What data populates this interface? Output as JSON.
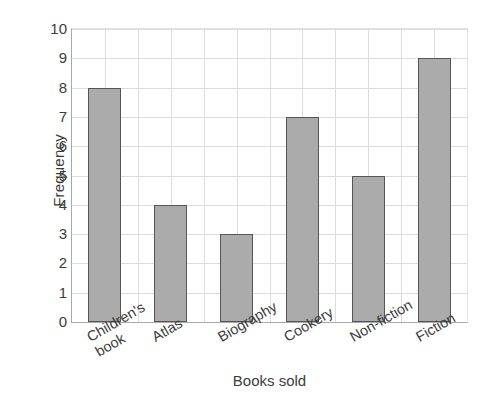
{
  "chart_data": {
    "type": "bar",
    "title": "",
    "xlabel": "Books sold",
    "ylabel": "Frequency",
    "categories": [
      "Children's book",
      "Atlas",
      "Biography",
      "Cookery",
      "Non-fiction",
      "Fiction"
    ],
    "values": [
      8,
      4,
      3,
      7,
      5,
      9
    ],
    "ylim": [
      0,
      10
    ],
    "y_ticks": [
      0,
      1,
      2,
      3,
      4,
      5,
      6,
      7,
      8,
      9,
      10
    ],
    "y_tick_labels": [
      "0",
      "1",
      "2",
      "3",
      "4",
      "5",
      "6",
      "7",
      "8",
      "9",
      "10"
    ],
    "grid": "both",
    "legend": "none",
    "bar_fill_color": "#ababab",
    "bar_edge_color": "#565656",
    "grid_color": "#dcdcdc",
    "axis_color": "#a9a9a9",
    "text_color": "#3c3c3c",
    "background_color": "#ffffff",
    "x_tick_label_rotation": -30,
    "category_label_lines": [
      [
        "Children's",
        "book"
      ],
      [
        "Atlas"
      ],
      [
        "Biography"
      ],
      [
        "Cookery"
      ],
      [
        "Non-fiction"
      ],
      [
        "Fiction"
      ]
    ]
  }
}
